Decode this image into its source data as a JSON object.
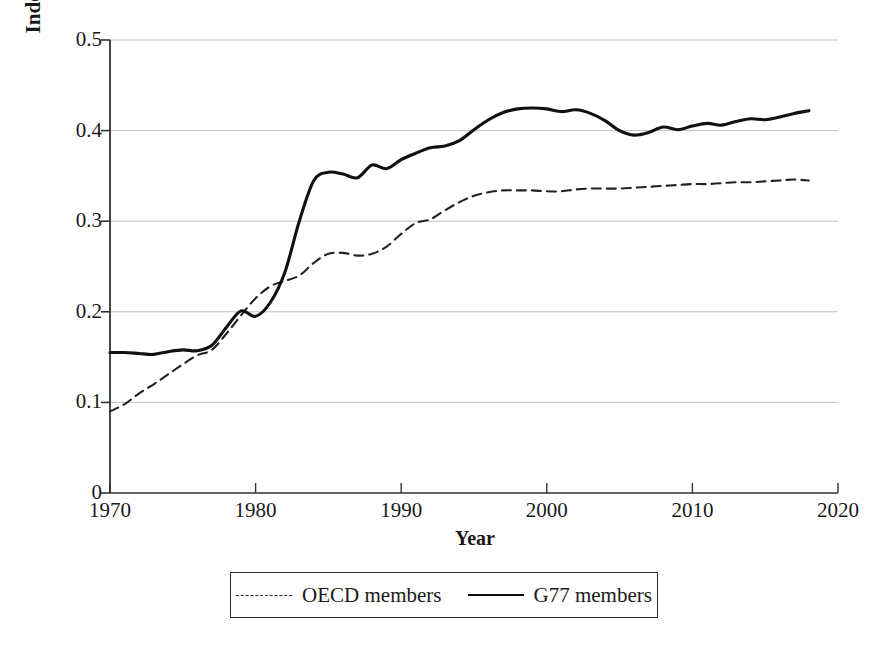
{
  "chart_data": {
    "type": "line",
    "title": "",
    "xlabel": "Year",
    "ylabel": "Index of overall source taxing rights",
    "xlim": [
      1970,
      2020
    ],
    "ylim": [
      0,
      0.5
    ],
    "xticks": [
      "1970",
      "1980",
      "1990",
      "2000",
      "2010",
      "2020"
    ],
    "yticks": [
      "0",
      "0.1",
      "0.2",
      "0.3",
      "0.4",
      "0.5"
    ],
    "grid": "horizontal",
    "legend_position": "bottom-outside",
    "x": [
      1970,
      1971,
      1972,
      1973,
      1974,
      1975,
      1976,
      1977,
      1978,
      1979,
      1980,
      1981,
      1982,
      1983,
      1984,
      1985,
      1986,
      1987,
      1988,
      1989,
      1990,
      1991,
      1992,
      1993,
      1994,
      1995,
      1996,
      1997,
      1998,
      1999,
      2000,
      2001,
      2002,
      2003,
      2004,
      2005,
      2006,
      2007,
      2008,
      2009,
      2010,
      2011,
      2012,
      2013,
      2014,
      2015,
      2016,
      2017,
      2018
    ],
    "series": [
      {
        "name": "OECD members",
        "style": "dashed",
        "color": "#222222",
        "values": [
          0.09,
          0.098,
          0.11,
          0.12,
          0.131,
          0.142,
          0.152,
          0.158,
          0.176,
          0.196,
          0.215,
          0.228,
          0.234,
          0.24,
          0.254,
          0.264,
          0.265,
          0.262,
          0.264,
          0.272,
          0.286,
          0.298,
          0.302,
          0.312,
          0.321,
          0.328,
          0.332,
          0.334,
          0.334,
          0.334,
          0.333,
          0.333,
          0.335,
          0.336,
          0.336,
          0.336,
          0.337,
          0.338,
          0.339,
          0.34,
          0.341,
          0.341,
          0.342,
          0.343,
          0.343,
          0.344,
          0.345,
          0.346,
          0.345
        ]
      },
      {
        "name": "G77 members",
        "style": "solid",
        "color": "#111111",
        "values": [
          0.155,
          0.155,
          0.154,
          0.153,
          0.156,
          0.158,
          0.157,
          0.163,
          0.183,
          0.201,
          0.195,
          0.21,
          0.243,
          0.3,
          0.345,
          0.354,
          0.352,
          0.348,
          0.362,
          0.358,
          0.368,
          0.375,
          0.381,
          0.383,
          0.389,
          0.401,
          0.412,
          0.42,
          0.424,
          0.425,
          0.424,
          0.421,
          0.423,
          0.419,
          0.411,
          0.4,
          0.395,
          0.398,
          0.404,
          0.401,
          0.405,
          0.408,
          0.406,
          0.41,
          0.413,
          0.412,
          0.415,
          0.419,
          0.422
        ]
      }
    ]
  },
  "legend": {
    "items": [
      {
        "label": "OECD members",
        "style": "dashed"
      },
      {
        "label": "G77 members",
        "style": "solid"
      }
    ]
  }
}
